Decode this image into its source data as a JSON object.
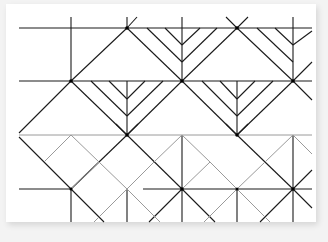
{
  "diagram": {
    "kind": "geometric crease-style line pattern",
    "colors": {
      "background": "#f3f3f3",
      "paper": "#ffffff",
      "dark_line": "#1a1a1a",
      "light_line": "#9a9a9a"
    },
    "grid": {
      "rows_y": [
        28,
        81,
        135,
        189
      ],
      "cols_x": [
        71,
        127,
        182,
        237,
        293
      ],
      "x_extent": [
        19,
        312
      ],
      "y_extent": [
        8,
        222
      ]
    }
  }
}
